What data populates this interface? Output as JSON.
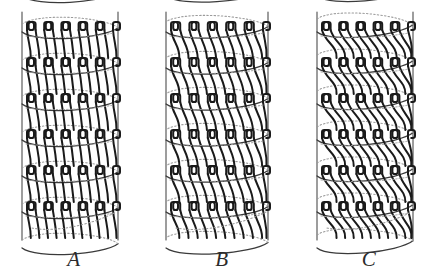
{
  "figure": {
    "background_color": "#ffffff",
    "ink_color": "#1a1a1a",
    "helix_color": "#3a3a3a",
    "hidden_color": "#9a9a9a",
    "axis_color": "#555555",
    "width": 443,
    "height": 276,
    "caption": ""
  },
  "panels": [
    {
      "id": "panel-a",
      "label": "A",
      "left": 0,
      "cylinder_left": 22,
      "cylinder_right": 118,
      "strand_count": 11,
      "band_count": 6,
      "pitch_angle_deg": 6,
      "description": "near-vertical interlocking strands on a narrow helix pitch"
    },
    {
      "id": "panel-b",
      "label": "B",
      "left": 148,
      "cylinder_left": 18,
      "cylinder_right": 120,
      "strand_count": 11,
      "band_count": 6,
      "pitch_angle_deg": 13,
      "description": "moderately slanted interlocking strands on a medium helix pitch"
    },
    {
      "id": "panel-c",
      "label": "C",
      "left": 295,
      "cylinder_left": 22,
      "cylinder_right": 118,
      "strand_count": 11,
      "band_count": 6,
      "pitch_angle_deg": 22,
      "description": "steeply crossed interlocking strands on a wide helix pitch"
    }
  ],
  "geometry": {
    "cylinder_top": 12,
    "cylinder_bottom": 240,
    "band_top": 22,
    "band_spacing": 36,
    "ellipse_ry": 9,
    "hook_width": 7,
    "hook_height": 8
  }
}
